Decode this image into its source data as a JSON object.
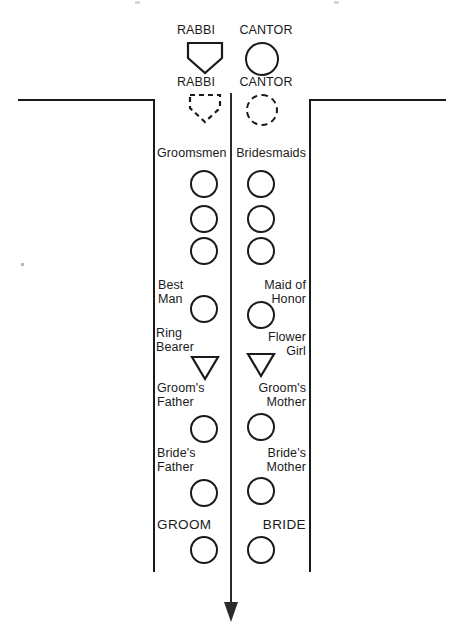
{
  "diagram": {
    "colors": {
      "ink": "#1a1a1a",
      "aisle": "#2b2b2b",
      "background": "#ffffff"
    },
    "officiants": {
      "standing_row": [
        {
          "label": "RABBI",
          "shape": "pentagon",
          "style": "solid"
        },
        {
          "label": "CANTOR",
          "shape": "circle",
          "style": "solid"
        }
      ],
      "alternate_row": [
        {
          "label": "RABBI",
          "shape": "pentagon",
          "style": "dashed"
        },
        {
          "label": "CANTOR",
          "shape": "circle",
          "style": "dashed"
        }
      ]
    },
    "party": {
      "groom_side_header": "Groomsmen",
      "bride_side_header": "Bridesmaids",
      "attendant_rows": 3,
      "rows": [
        {
          "left_label": "Best\nMan",
          "left_shape": "circle",
          "right_label": "Maid of\nHonor",
          "right_shape": "circle"
        },
        {
          "left_label": "Ring\nBearer",
          "left_shape": "triangle",
          "right_label": "Flower\nGirl",
          "right_shape": "triangle"
        },
        {
          "left_label": "Groom's\nFather",
          "left_shape": "circle",
          "right_label": "Groom's\nMother",
          "right_shape": "circle"
        },
        {
          "left_label": "Bride's\nFather",
          "left_shape": "circle",
          "right_label": "Bride's\nMother",
          "right_shape": "circle"
        },
        {
          "left_label": "GROOM",
          "left_shape": "circle",
          "right_label": "BRIDE",
          "right_shape": "circle"
        }
      ]
    },
    "aisle": {
      "direction_icon": "down-arrow-icon",
      "description": "center aisle"
    }
  }
}
